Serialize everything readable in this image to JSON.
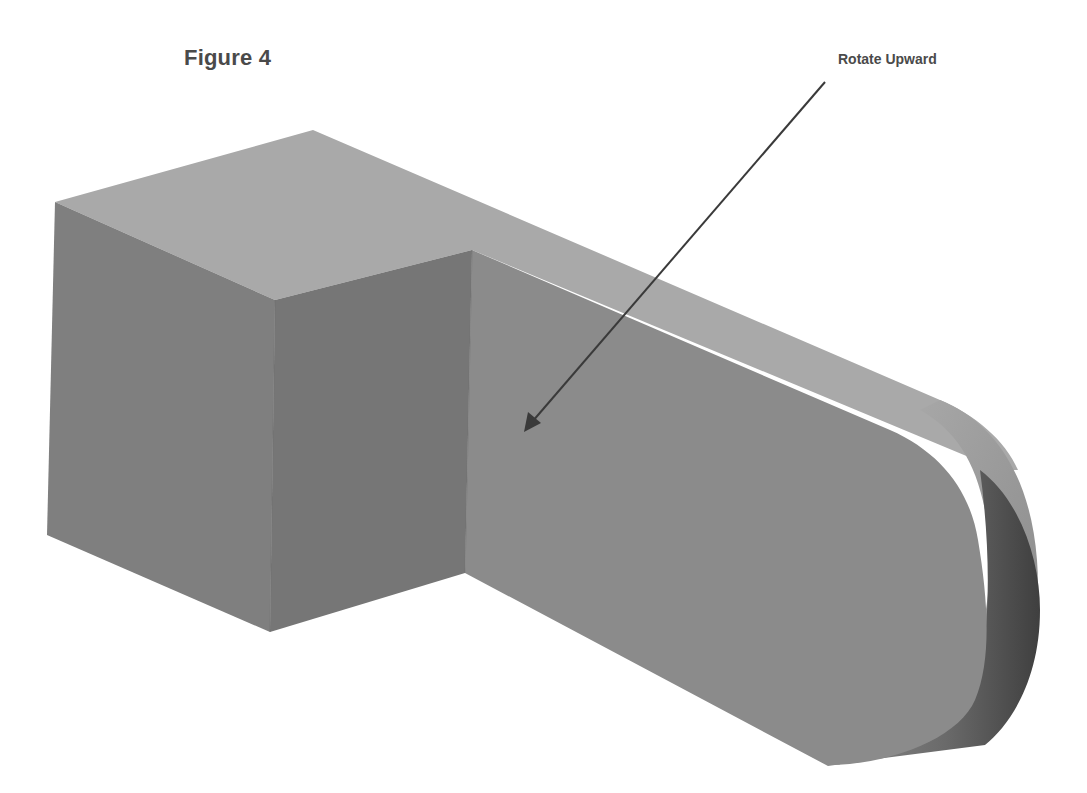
{
  "figure": {
    "title": "Figure 4",
    "callout": {
      "label": "Rotate Upward",
      "arrow": {
        "from": [
          825,
          82
        ],
        "to": [
          524,
          432
        ]
      }
    },
    "colors": {
      "background": "#ffffff",
      "text": "#4a4a4a",
      "top_face": "#a9a9a9",
      "left_face": "#7f7f7f",
      "front_face_block": "#777777",
      "front_face_bar": "#8a8a8a",
      "rounded_end_light": "#8e8e8e",
      "rounded_end_dark": "#4f4f4f",
      "arrow": "#3a3a3a"
    }
  }
}
